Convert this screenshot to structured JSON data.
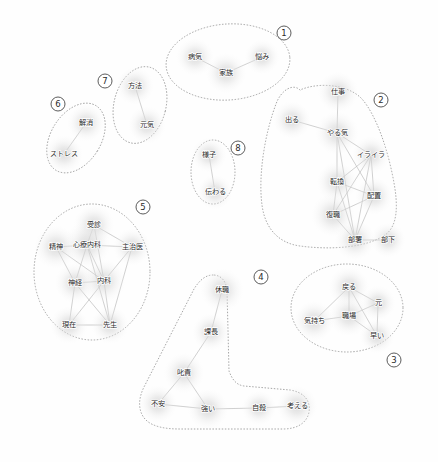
{
  "figure": {
    "type": "co-occurrence-network",
    "width": 438,
    "height": 462,
    "background_color": "#fefefe",
    "node_halo_color": "#d8d8d8",
    "edge_color": "#b9b9b9",
    "outline_color": "#8d8d8d",
    "label_color": "#2b2b2b"
  },
  "chart_data": {
    "type": "scatter",
    "title": "",
    "xlabel": "",
    "ylabel": "",
    "grid": false,
    "legend": "none",
    "xlim": [
      0,
      438
    ],
    "ylim": [
      0,
      462
    ],
    "clusters": [
      {
        "id": 1,
        "badge": "①",
        "badge_x": 284,
        "badge_y": 33,
        "shape": "ellipse",
        "cx": 228,
        "cy": 62,
        "rx": 62,
        "ry": 38,
        "rotate": -4,
        "nodes": [
          {
            "label": "病気",
            "x": 195,
            "y": 57,
            "size": 13,
            "font": 7.2
          },
          {
            "label": "家族",
            "x": 226,
            "y": 73,
            "size": 14,
            "font": 7.2
          },
          {
            "label": "悩み",
            "x": 262,
            "y": 57,
            "size": 12,
            "font": 7.2
          }
        ],
        "edges": [
          [
            0,
            1
          ],
          [
            1,
            2
          ]
        ]
      },
      {
        "id": 2,
        "badge": "②",
        "badge_x": 381,
        "badge_y": 100,
        "shape": "path",
        "path": "M 300 90 C 293 83 281 90 276 104 C 265 133 258 175 262 205 C 265 228 278 243 300 246 C 330 250 366 248 385 235 C 398 226 398 205 394 183 C 388 149 376 115 362 99 C 348 84 318 82 300 90 Z",
        "nodes": [
          {
            "label": "仕事",
            "x": 338,
            "y": 92,
            "size": 14,
            "font": 7.2
          },
          {
            "label": "出る",
            "x": 292,
            "y": 120,
            "size": 13,
            "font": 7.2
          },
          {
            "label": "やる気",
            "x": 337,
            "y": 133,
            "size": 15,
            "font": 7.2
          },
          {
            "label": "イライラ",
            "x": 371,
            "y": 155,
            "size": 13,
            "font": 7.0
          },
          {
            "label": "転換",
            "x": 337,
            "y": 182,
            "size": 14,
            "font": 7.2
          },
          {
            "label": "配置",
            "x": 374,
            "y": 196,
            "size": 13,
            "font": 7.2
          },
          {
            "label": "復職",
            "x": 333,
            "y": 215,
            "size": 15,
            "font": 7.2
          },
          {
            "label": "部署",
            "x": 355,
            "y": 240,
            "size": 14,
            "font": 7.2
          },
          {
            "label": "部下",
            "x": 388,
            "y": 240,
            "size": 12,
            "font": 7.2
          }
        ],
        "edges": [
          [
            0,
            2
          ],
          [
            1,
            2
          ],
          [
            2,
            3
          ],
          [
            2,
            4
          ],
          [
            2,
            5
          ],
          [
            2,
            7
          ],
          [
            3,
            4
          ],
          [
            3,
            5
          ],
          [
            3,
            6
          ],
          [
            3,
            7
          ],
          [
            4,
            5
          ],
          [
            4,
            6
          ],
          [
            4,
            7
          ],
          [
            5,
            6
          ],
          [
            5,
            7
          ],
          [
            6,
            7
          ],
          [
            7,
            8
          ]
        ]
      },
      {
        "id": 3,
        "badge": "③",
        "badge_x": 394,
        "badge_y": 360,
        "shape": "ellipse",
        "cx": 347,
        "cy": 308,
        "rx": 56,
        "ry": 44,
        "rotate": 0,
        "nodes": [
          {
            "label": "戻る",
            "x": 349,
            "y": 287,
            "size": 14,
            "font": 7.2
          },
          {
            "label": "元",
            "x": 378,
            "y": 303,
            "size": 12,
            "font": 7.2
          },
          {
            "label": "気持ち",
            "x": 314,
            "y": 321,
            "size": 14,
            "font": 7.2
          },
          {
            "label": "職場",
            "x": 349,
            "y": 316,
            "size": 14,
            "font": 7.2
          },
          {
            "label": "早い",
            "x": 377,
            "y": 336,
            "size": 12,
            "font": 7.2
          }
        ],
        "edges": [
          [
            0,
            1
          ],
          [
            0,
            2
          ],
          [
            0,
            3
          ],
          [
            0,
            4
          ],
          [
            1,
            3
          ],
          [
            1,
            4
          ],
          [
            2,
            3
          ],
          [
            3,
            4
          ]
        ]
      },
      {
        "id": 4,
        "badge": "④",
        "badge_x": 261,
        "badge_y": 277,
        "shape": "path",
        "path": "M 213 275 C 205 275 199 281 194 289 L 144 387 C 138 399 138 411 145 419 C 152 427 166 429 180 429 L 283 429 C 297 429 307 423 309 412 C 311 400 303 392 290 390 L 244 386 C 236 385 232 379 229 371 L 227 290 C 226 281 221 275 213 275 Z",
        "nodes": [
          {
            "label": "休職",
            "x": 222,
            "y": 290,
            "size": 15,
            "font": 7.2
          },
          {
            "label": "課長",
            "x": 211,
            "y": 332,
            "size": 13,
            "font": 7.2
          },
          {
            "label": "叱責",
            "x": 184,
            "y": 373,
            "size": 14,
            "font": 7.2
          },
          {
            "label": "不安",
            "x": 158,
            "y": 404,
            "size": 13,
            "font": 7.2
          },
          {
            "label": "強い",
            "x": 208,
            "y": 409,
            "size": 14,
            "font": 7.2
          },
          {
            "label": "自殺",
            "x": 259,
            "y": 408,
            "size": 12,
            "font": 7.2
          },
          {
            "label": "考える",
            "x": 297,
            "y": 406,
            "size": 14,
            "font": 7.2
          }
        ],
        "edges": [
          [
            0,
            1
          ],
          [
            1,
            2
          ],
          [
            2,
            3
          ],
          [
            2,
            4
          ],
          [
            3,
            4
          ],
          [
            4,
            5
          ],
          [
            5,
            6
          ]
        ]
      },
      {
        "id": 5,
        "badge": "⑤",
        "badge_x": 143,
        "badge_y": 207,
        "shape": "ellipse",
        "cx": 92,
        "cy": 272,
        "rx": 58,
        "ry": 68,
        "rotate": 0,
        "nodes": [
          {
            "label": "受診",
            "x": 94,
            "y": 225,
            "size": 14,
            "font": 7.2
          },
          {
            "label": "精神",
            "x": 56,
            "y": 247,
            "size": 15,
            "font": 7.2
          },
          {
            "label": "心療内科",
            "x": 87,
            "y": 245,
            "size": 16,
            "font": 7.0
          },
          {
            "label": "主治医",
            "x": 132,
            "y": 247,
            "size": 13,
            "font": 7.2
          },
          {
            "label": "神経",
            "x": 75,
            "y": 283,
            "size": 14,
            "font": 7.2
          },
          {
            "label": "内科",
            "x": 104,
            "y": 281,
            "size": 15,
            "font": 7.2
          },
          {
            "label": "現在",
            "x": 69,
            "y": 325,
            "size": 13,
            "font": 7.2
          },
          {
            "label": "先生",
            "x": 110,
            "y": 325,
            "size": 13,
            "font": 7.2
          }
        ],
        "edges": [
          [
            0,
            2
          ],
          [
            0,
            3
          ],
          [
            0,
            5
          ],
          [
            1,
            2
          ],
          [
            1,
            4
          ],
          [
            1,
            5
          ],
          [
            2,
            3
          ],
          [
            2,
            4
          ],
          [
            2,
            5
          ],
          [
            2,
            7
          ],
          [
            3,
            5
          ],
          [
            3,
            7
          ],
          [
            4,
            5
          ],
          [
            4,
            6
          ],
          [
            4,
            7
          ],
          [
            5,
            6
          ],
          [
            5,
            7
          ],
          [
            6,
            7
          ]
        ]
      },
      {
        "id": 6,
        "badge": "⑥",
        "badge_x": 58,
        "badge_y": 104,
        "shape": "ellipse",
        "cx": 76,
        "cy": 138,
        "rx": 25,
        "ry": 38,
        "rotate": 32,
        "nodes": [
          {
            "label": "解消",
            "x": 86,
            "y": 123,
            "size": 13,
            "font": 7.2
          },
          {
            "label": "ストレス",
            "x": 64,
            "y": 154,
            "size": 13,
            "font": 7.0
          }
        ],
        "edges": [
          [
            0,
            1
          ]
        ]
      },
      {
        "id": 7,
        "badge": "⑦",
        "badge_x": 105,
        "badge_y": 81,
        "shape": "ellipse",
        "cx": 140,
        "cy": 105,
        "rx": 26,
        "ry": 39,
        "rotate": 14,
        "nodes": [
          {
            "label": "方法",
            "x": 135,
            "y": 86,
            "size": 13,
            "font": 7.2
          },
          {
            "label": "元気",
            "x": 147,
            "y": 125,
            "size": 13,
            "font": 7.2
          }
        ],
        "edges": [
          [
            0,
            1
          ]
        ]
      },
      {
        "id": 8,
        "badge": "⑧",
        "badge_x": 238,
        "badge_y": 148,
        "shape": "ellipse",
        "cx": 213,
        "cy": 172,
        "rx": 22,
        "ry": 32,
        "rotate": 0,
        "nodes": [
          {
            "label": "様子",
            "x": 209,
            "y": 155,
            "size": 12,
            "font": 7.2
          },
          {
            "label": "伝わる",
            "x": 215,
            "y": 192,
            "size": 12,
            "font": 7.2
          }
        ],
        "edges": [
          [
            0,
            1
          ]
        ]
      }
    ]
  }
}
